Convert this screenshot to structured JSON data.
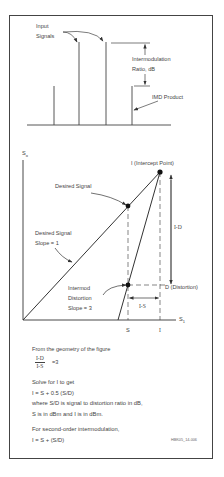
{
  "spectrum": {
    "input_signals_label_line1": "Input",
    "input_signals_label_line2": "Signals",
    "ratio_label_line1": "Intermodulation",
    "ratio_label_line2": "Ratio, dB",
    "imd_product_label": "IMD Product"
  },
  "intercept_chart": {
    "y_axis_label": "S",
    "y_axis_sub": "o",
    "x_axis_label": "S",
    "x_axis_sub": "1",
    "intercept_label": "I (Intercept Point)",
    "desired_signal_label": "Desired Signal",
    "desired_slope_line1": "Desired Signal",
    "desired_slope_line2": "Slope = 1",
    "intermod_line1": "Intermod",
    "intermod_line2": "Distortion",
    "intermod_line3": "Slope = 3",
    "distortion_label": "D  (Distortion)",
    "i_minus_d": "I-D",
    "i_minus_s": "I-S",
    "x_tick_s": "S",
    "x_tick_i": "I"
  },
  "explanation": {
    "geometry_text": "From the geometry of the figure",
    "fraction_num": "I-D",
    "fraction_den": "I-S",
    "fraction_eq": "=3",
    "solve_text": "Solve for I to get",
    "formula1": "I = S + 0.5 (S/D)",
    "where_text": "where S/D is signal to distortion ratio in dB,",
    "units_text": "S is in dBm and I is in dBm.",
    "second_order_text": "For second-order intermodulation,",
    "formula2": "I = S + (S/D)",
    "figure_code": "HBK05_14-006"
  }
}
